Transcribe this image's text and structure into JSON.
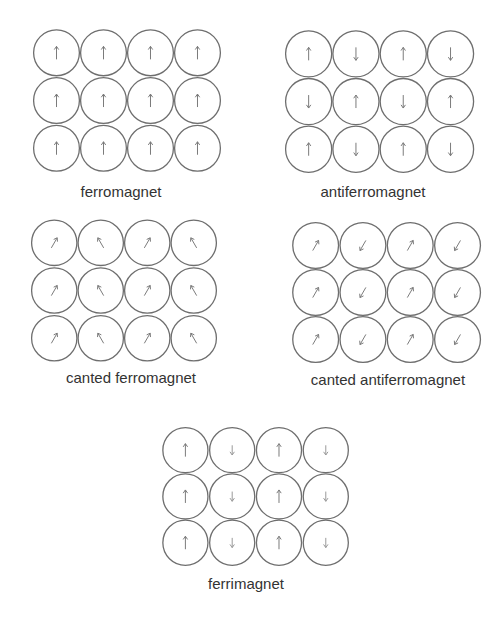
{
  "diagram": {
    "colors": {
      "background": "#ffffff",
      "circle_stroke": "#6e6e6e",
      "arrow": "#7a7a7a",
      "arrow_weak": "#9a9a9a",
      "label": "#333333"
    },
    "panels": [
      {
        "id": "ferromagnet",
        "label": "ferromagnet",
        "x": 33,
        "y": 29,
        "cell_w": 47,
        "cell_h": 47.7,
        "label_x": 121,
        "label_y": 184,
        "grid": [
          [
            "up",
            "up",
            "up",
            "up"
          ],
          [
            "up",
            "up",
            "up",
            "up"
          ],
          [
            "up",
            "up",
            "up",
            "up"
          ]
        ]
      },
      {
        "id": "antiferromagnet",
        "label": "antiferromagnet",
        "x": 285,
        "y": 30,
        "cell_w": 47.3,
        "cell_h": 47.7,
        "label_x": 373,
        "label_y": 184,
        "grid": [
          [
            "up",
            "down",
            "up",
            "down"
          ],
          [
            "down",
            "up",
            "down",
            "up"
          ],
          [
            "up",
            "down",
            "up",
            "down"
          ]
        ]
      },
      {
        "id": "canted-ferromagnet",
        "label": "canted ferromagnet",
        "x": 31,
        "y": 219,
        "cell_w": 46.5,
        "cell_h": 47.7,
        "label_x": 131,
        "label_y": 370,
        "grid": [
          [
            "up-right",
            "up-left",
            "up-right",
            "up-left"
          ],
          [
            "up-right",
            "up-left",
            "up-right",
            "up-left"
          ],
          [
            "up-right",
            "up-left",
            "up-right",
            "up-left"
          ]
        ]
      },
      {
        "id": "canted-antiferromagnet",
        "label": "canted antiferromagnet",
        "x": 292,
        "y": 222,
        "cell_w": 47.3,
        "cell_h": 47,
        "label_x": 388,
        "label_y": 372,
        "grid": [
          [
            "up-right",
            "down-left",
            "up-right",
            "down-left"
          ],
          [
            "up-right",
            "down-left",
            "up-right",
            "down-left"
          ],
          [
            "up-right",
            "down-left",
            "up-right",
            "down-left"
          ]
        ]
      },
      {
        "id": "ferrimagnet",
        "label": "ferrimagnet",
        "x": 162,
        "y": 427,
        "cell_w": 46.8,
        "cell_h": 46.3,
        "label_x": 246,
        "label_y": 576,
        "grid": [
          [
            "up",
            "down-small",
            "up",
            "down-small"
          ],
          [
            "up",
            "down-small",
            "up",
            "down-small"
          ],
          [
            "up",
            "down-small",
            "up",
            "down-small"
          ]
        ]
      }
    ]
  }
}
